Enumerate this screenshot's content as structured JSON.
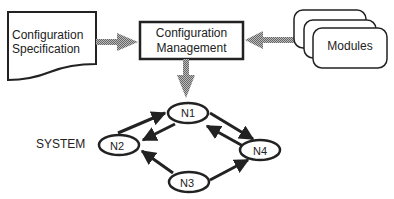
{
  "diagram": {
    "spec": {
      "line1": "Configuration",
      "line2": "Specification"
    },
    "mgmt": {
      "line1": "Configuration",
      "line2": "Management"
    },
    "modules": {
      "label": "Modules"
    },
    "system": {
      "label": "SYSTEM"
    },
    "nodes": [
      {
        "id": "N1",
        "label": "N1"
      },
      {
        "id": "N2",
        "label": "N2"
      },
      {
        "id": "N3",
        "label": "N3"
      },
      {
        "id": "N4",
        "label": "N4"
      }
    ],
    "edges": [
      {
        "from": "N2",
        "to": "N1"
      },
      {
        "from": "N1",
        "to": "N2"
      },
      {
        "from": "N1",
        "to": "N4"
      },
      {
        "from": "N4",
        "to": "N1"
      },
      {
        "from": "N3",
        "to": "N2"
      },
      {
        "from": "N3",
        "to": "N4"
      }
    ],
    "colors": {
      "stroke": "#222222",
      "hatch": "#888888"
    }
  }
}
